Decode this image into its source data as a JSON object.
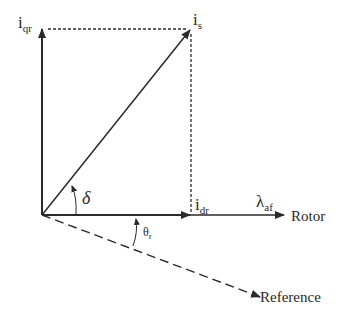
{
  "diagram": {
    "type": "phasor-vector-diagram",
    "colors": {
      "line": "#2a2a2a",
      "background": "#ffffff"
    },
    "labels": {
      "iqr": {
        "main": "i",
        "sub": "qr"
      },
      "is": {
        "main": "i",
        "sub": "s"
      },
      "idr": {
        "main": "i",
        "sub": "dr"
      },
      "lambda_af": {
        "main": "λ",
        "sub": "af"
      },
      "rotor": "Rotor",
      "reference": "Reference",
      "delta": "δ",
      "theta_r": {
        "main": "θ",
        "sub": "r"
      }
    }
  }
}
